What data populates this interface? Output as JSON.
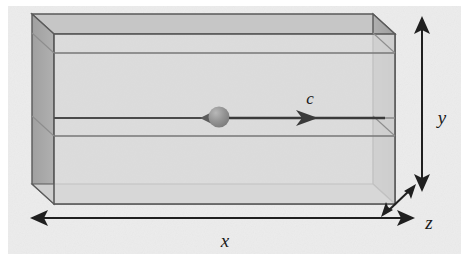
{
  "figure": {
    "name": "rectangular-cavity-with-moving-particle",
    "type": "3d-box-diagram",
    "background_color": "#ececec",
    "canvas": {
      "width": 469,
      "height": 266
    }
  },
  "box": {
    "front_face_color": "#d4d4d4",
    "left_face_color": "#a8a8a8",
    "right_face_color": "#a8a8a8",
    "top_face_color": "#c4c4c4",
    "edge_color": "#5a5a5a",
    "front": {
      "x1": 54,
      "y1": 34,
      "x2": 395,
      "y2": 204
    },
    "depth_dx": -22,
    "depth_dy": -20
  },
  "interior_lines": [
    {
      "name": "upper-rail",
      "y": 53
    },
    {
      "name": "particle-path",
      "y": 118
    },
    {
      "name": "lower-rail",
      "y": 136
    }
  ],
  "particle": {
    "name": "moving-particle",
    "cx": 219,
    "cy": 117,
    "r": 10,
    "fill_color": "#8f8f8f",
    "highlight_color": "#b5b5b5"
  },
  "velocity_arrow": {
    "name": "velocity-vector",
    "label": "c",
    "label_x": 310,
    "label_y": 104,
    "from_x": 229,
    "to_x": 385,
    "y": 118,
    "color": "#3a3a3a"
  },
  "dimensions": [
    {
      "id": "x",
      "label": "x",
      "orientation": "horizontal",
      "arrowheads": "both",
      "label_x": 225,
      "label_y": 245,
      "line": {
        "x1": 33,
        "y1": 218,
        "x2": 412,
        "y2": 218
      }
    },
    {
      "id": "y",
      "label": "y",
      "orientation": "vertical",
      "arrowheads": "both",
      "label_x": 443,
      "label_y": 131,
      "line": {
        "x1": 422,
        "y1": 22,
        "x2": 422,
        "y2": 186
      }
    },
    {
      "id": "z",
      "label": "z",
      "orientation": "diagonal",
      "arrowheads": "both",
      "label_x": 428,
      "label_y": 225,
      "line": {
        "x1": 415,
        "y1": 186,
        "x2": 387,
        "y2": 213
      }
    }
  ],
  "colors": {
    "ink": "#1a1a1a",
    "edge": "#5a5a5a",
    "arrow": "#2b2b2b",
    "backdrop": "#ececec"
  }
}
